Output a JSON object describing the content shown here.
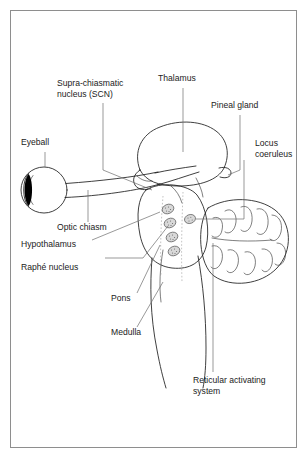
{
  "figure": {
    "border_color": "#8e8e8e",
    "background_color": "#ffffff",
    "line_color": "#1e1e1e",
    "leader_color": "#6d6d6d",
    "text_color": "#1b1b1b"
  },
  "labels": {
    "supra_chiasmatic_line1": "Supra-chiasmatic",
    "supra_chiasmatic_line2": "nucleus (SCN)",
    "thalamus": "Thalamus",
    "pineal_gland": "Pineal gland",
    "eyeball": "Eyeball",
    "locus_line1": "Locus",
    "locus_line2": "coeruleus",
    "optic_chiasm": "Optic chiasm",
    "hypothalamus": "Hypothalamus",
    "raphe_nucleus": "Raphé nucleus",
    "pons": "Pons",
    "medulla": "Medulla",
    "ras_line1": "Reticular activating",
    "ras_line2": "system"
  },
  "structures": [
    {
      "name": "eyeball",
      "label": "Eyeball"
    },
    {
      "name": "optic-nerve",
      "label": "Optic nerve"
    },
    {
      "name": "optic-chiasm",
      "label": "Optic chiasm"
    },
    {
      "name": "suprachiasmatic-nucleus",
      "label": "Supra-chiasmatic nucleus (SCN)"
    },
    {
      "name": "thalamus",
      "label": "Thalamus"
    },
    {
      "name": "pineal-gland",
      "label": "Pineal gland"
    },
    {
      "name": "locus-coeruleus",
      "label": "Locus coeruleus"
    },
    {
      "name": "hypothalamus",
      "label": "Hypothalamus"
    },
    {
      "name": "raphe-nucleus",
      "label": "Raphé nucleus"
    },
    {
      "name": "pons",
      "label": "Pons"
    },
    {
      "name": "medulla",
      "label": "Medulla"
    },
    {
      "name": "cerebellum",
      "label": "Cerebellum"
    },
    {
      "name": "reticular-activating-system",
      "label": "Reticular activating system"
    }
  ]
}
